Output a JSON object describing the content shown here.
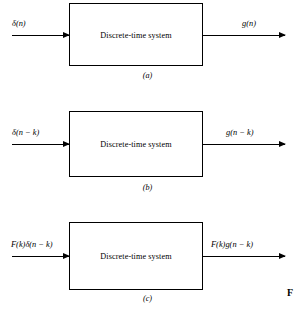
{
  "figure": {
    "marker": "F",
    "block_label": "Discrete-time system",
    "panels": [
      {
        "id": "a",
        "caption": "(a)",
        "input_label": "δ(n)",
        "output_label": "g(n)",
        "block_label": "Discrete-time system"
      },
      {
        "id": "b",
        "caption": "(b)",
        "input_label": "δ(n − k)",
        "output_label": "g(n − k)",
        "block_label": "Discrete-time system"
      },
      {
        "id": "c",
        "caption": "(c)",
        "input_label": "F(k)δ(n − k)",
        "output_label": "F(k)g(n − k)",
        "block_label": "Discrete-time system"
      }
    ]
  },
  "colors": {
    "ink": "#000000",
    "paper": "#ffffff"
  }
}
